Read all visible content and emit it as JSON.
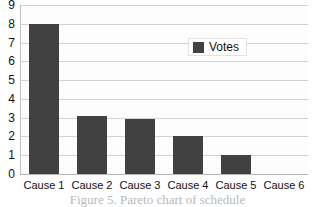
{
  "chart_data": {
    "type": "bar",
    "title": "",
    "xlabel": "",
    "ylabel": "",
    "categories": [
      "Cause 1",
      "Cause 2",
      "Cause 3",
      "Cause 4",
      "Cause 5",
      "Cause 6"
    ],
    "series": [
      {
        "name": "Votes",
        "values": [
          8,
          3.1,
          2.95,
          2,
          1,
          0
        ]
      }
    ],
    "ylim": [
      0,
      9
    ],
    "ytick_labels": [
      "9",
      "8",
      "7",
      "6",
      "5",
      "4",
      "3",
      "2",
      "1",
      "0"
    ],
    "ytick_values": [
      9,
      8,
      7,
      6,
      5,
      4,
      3,
      2,
      1,
      0
    ],
    "grid": true,
    "legend_position": "upper-right-inside",
    "colors": {
      "bar_fill": "#414141",
      "gridline": "#d2d2d2",
      "axis_line": "#b4b4b4",
      "plot_background": "#fdfdfd",
      "text": "#111111"
    }
  },
  "legend": {
    "entries": [
      {
        "label": "Votes",
        "swatch_color": "#414141"
      }
    ]
  },
  "caption": {
    "text": "Figure 5. Pareto chart of schedule"
  }
}
